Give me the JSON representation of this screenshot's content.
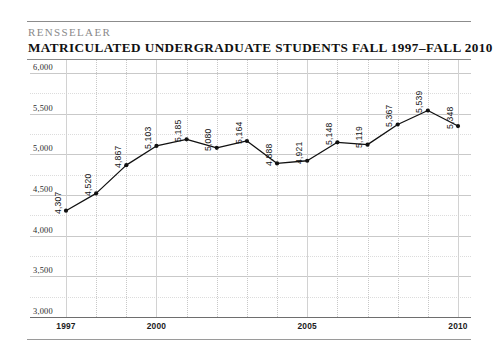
{
  "header": {
    "brand": "RENSSELAER",
    "title": "MATRICULATED UNDERGRADUATE STUDENTS FALL 1997–FALL 2010"
  },
  "chart_data": {
    "type": "line",
    "title": "MATRICULATED UNDERGRADUATE STUDENTS FALL 1997–FALL 2010",
    "xlabel": "",
    "ylabel": "",
    "categories": [
      1997,
      1998,
      1999,
      2000,
      2001,
      2002,
      2003,
      2004,
      2005,
      2006,
      2007,
      2008,
      2009,
      2010
    ],
    "values": [
      4307,
      4520,
      4867,
      5103,
      5185,
      5080,
      5164,
      4888,
      4921,
      5148,
      5119,
      5367,
      5539,
      5348
    ],
    "point_labels": [
      "4,307",
      "4,520",
      "4,867",
      "5,103",
      "5,185",
      "5,080",
      "5,164",
      "4,888",
      "4,921",
      "5,148",
      "5,119",
      "5,367",
      "5,539",
      "5,348"
    ],
    "ylim": [
      3000,
      6000
    ],
    "ytick_values": [
      6000,
      5500,
      5000,
      4500,
      4000,
      3500,
      3000
    ],
    "ytick_labels": [
      "6,000",
      "5,500",
      "5,000",
      "4,500",
      "4,000",
      "3,500",
      "3,000"
    ],
    "yminor_values": [
      5750,
      5250,
      4750,
      4250,
      3750,
      3250
    ],
    "xtick_values": [
      1997,
      2000,
      2005,
      2010
    ],
    "xtick_labels": [
      "1997",
      "2000",
      "2005",
      "2010"
    ],
    "xlim": [
      1997,
      2010
    ],
    "grid": true,
    "legend": null,
    "series_color": "#111111",
    "marker": "circle"
  },
  "colors": {
    "brand_text": "#8a8a8a",
    "title_text": "#111111",
    "rule": "#8c8c8c",
    "grid_major": "#c9c9c9",
    "grid_minor": "#dcdcdc",
    "axis": "#6e6e6e",
    "line": "#111111"
  }
}
